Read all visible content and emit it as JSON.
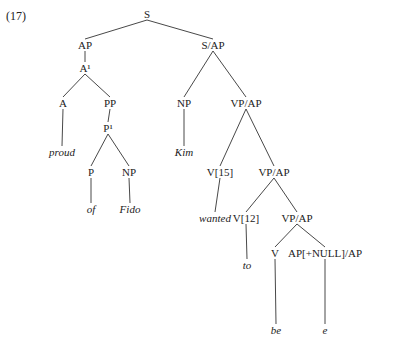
{
  "example_number": "(17)",
  "tree": {
    "nodes": [
      {
        "id": "S",
        "label": "S",
        "x": 147,
        "y": 14,
        "word": false
      },
      {
        "id": "AP",
        "label": "AP",
        "x": 85,
        "y": 45,
        "word": false
      },
      {
        "id": "SAP",
        "label": "S/AP",
        "x": 213,
        "y": 45,
        "word": false
      },
      {
        "id": "Abar",
        "label": "A¹",
        "x": 85,
        "y": 68,
        "word": false
      },
      {
        "id": "A",
        "label": "A",
        "x": 63,
        "y": 103,
        "word": false
      },
      {
        "id": "PP",
        "label": "PP",
        "x": 110,
        "y": 103,
        "word": false
      },
      {
        "id": "NP1",
        "label": "NP",
        "x": 184,
        "y": 103,
        "word": false
      },
      {
        "id": "VPAP1",
        "label": "VP/AP",
        "x": 246,
        "y": 103,
        "word": false
      },
      {
        "id": "proud",
        "label": "proud",
        "x": 62,
        "y": 152,
        "word": true
      },
      {
        "id": "Pbar",
        "label": "P¹",
        "x": 108,
        "y": 128,
        "word": false
      },
      {
        "id": "Kim",
        "label": "Kim",
        "x": 184,
        "y": 152,
        "word": true
      },
      {
        "id": "P",
        "label": "P",
        "x": 91,
        "y": 172,
        "word": false
      },
      {
        "id": "NP2",
        "label": "NP",
        "x": 129,
        "y": 172,
        "word": false
      },
      {
        "id": "V15",
        "label": "V[15]",
        "x": 220,
        "y": 172,
        "word": false
      },
      {
        "id": "VPAP2",
        "label": "VP/AP",
        "x": 274,
        "y": 172,
        "word": false
      },
      {
        "id": "of",
        "label": "of",
        "x": 91,
        "y": 209,
        "word": true
      },
      {
        "id": "Fido",
        "label": "Fido",
        "x": 130,
        "y": 209,
        "word": true
      },
      {
        "id": "wanted",
        "label": "wanted",
        "x": 215,
        "y": 218,
        "word": true
      },
      {
        "id": "V12",
        "label": "V[12]",
        "x": 246,
        "y": 218,
        "word": false
      },
      {
        "id": "VPAP3",
        "label": "VP/AP",
        "x": 297,
        "y": 218,
        "word": false
      },
      {
        "id": "to",
        "label": "to",
        "x": 247,
        "y": 265,
        "word": true
      },
      {
        "id": "V",
        "label": "V",
        "x": 275,
        "y": 253,
        "word": false
      },
      {
        "id": "APNULL",
        "label": "AP[+NULL]/AP",
        "x": 325,
        "y": 253,
        "word": false
      },
      {
        "id": "be",
        "label": "be",
        "x": 276,
        "y": 330,
        "word": true
      },
      {
        "id": "e",
        "label": "e",
        "x": 325,
        "y": 330,
        "word": true
      }
    ],
    "edges": [
      [
        "S",
        "AP"
      ],
      [
        "S",
        "SAP"
      ],
      [
        "AP",
        "Abar"
      ],
      [
        "Abar",
        "A"
      ],
      [
        "Abar",
        "PP"
      ],
      [
        "A",
        "proud"
      ],
      [
        "PP",
        "Pbar"
      ],
      [
        "Pbar",
        "P"
      ],
      [
        "Pbar",
        "NP2"
      ],
      [
        "P",
        "of"
      ],
      [
        "NP2",
        "Fido"
      ],
      [
        "SAP",
        "NP1"
      ],
      [
        "SAP",
        "VPAP1"
      ],
      [
        "NP1",
        "Kim"
      ],
      [
        "VPAP1",
        "V15"
      ],
      [
        "VPAP1",
        "VPAP2"
      ],
      [
        "V15",
        "wanted"
      ],
      [
        "VPAP2",
        "V12"
      ],
      [
        "VPAP2",
        "VPAP3"
      ],
      [
        "V12",
        "to"
      ],
      [
        "VPAP3",
        "V"
      ],
      [
        "VPAP3",
        "APNULL"
      ],
      [
        "V",
        "be"
      ],
      [
        "APNULL",
        "e"
      ]
    ]
  }
}
